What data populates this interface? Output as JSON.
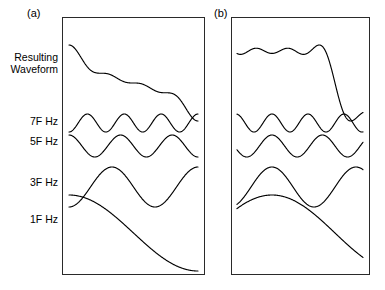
{
  "figure": {
    "type": "waveform-synthesis-diagram",
    "background": "#ffffff",
    "stroke_color": "#000000",
    "panel_border_color": "#2a2a2a"
  },
  "panels": [
    {
      "id": "a",
      "label": "(a)",
      "box": {
        "x": 62,
        "y": 17,
        "w": 143,
        "h": 258
      },
      "description": "All harmonics in cosine phase; sum is a flat-topped square-wave approximation with Gibbs ripples"
    },
    {
      "id": "b",
      "label": "(b)",
      "box": {
        "x": 231,
        "y": 17,
        "w": 139,
        "h": 258
      },
      "description": "Harmonics progressively phase-shifted; sum is a single sharp asymmetric peak"
    }
  ],
  "row_labels": {
    "resulting_line1": "Resulting",
    "resulting_line2": "Waveform",
    "harmonic_7": "7F Hz",
    "harmonic_5": "5F Hz",
    "harmonic_3": "3F Hz",
    "harmonic_1": "1F Hz"
  },
  "chart_data": {
    "type": "line",
    "title": "",
    "xlabel": "",
    "ylabel": "",
    "grid": false,
    "legend": "none",
    "x": {
      "range": [
        0,
        1
      ],
      "units": "normalized time",
      "ticks": []
    },
    "rows": [
      {
        "name": "Resulting Waveform",
        "label": "Resulting Waveform",
        "baseline_y": 82,
        "amplitude": 38
      },
      {
        "name": "7F Hz",
        "label": "7F Hz",
        "harmonic": 7,
        "baseline_y": 122,
        "amplitude": 9
      },
      {
        "name": "5F Hz",
        "label": "5F Hz",
        "harmonic": 5,
        "baseline_y": 145,
        "amplitude": 11
      },
      {
        "name": "3F Hz",
        "label": "3F Hz",
        "harmonic": 3,
        "baseline_y": 186,
        "amplitude": 20
      },
      {
        "name": "1F Hz",
        "label": "1F Hz",
        "harmonic": 1,
        "baseline_y": 232,
        "amplitude": 38
      }
    ],
    "series": [
      {
        "name": "panel-a-harmonic-1",
        "panel": "a",
        "harmonic": 1,
        "amplitude": 1.0,
        "phase_deg": 0,
        "cycles_in_window": 0.5,
        "values": [
          -0.99,
          -0.89,
          -0.67,
          -0.35,
          0.0,
          0.34,
          0.66,
          0.89,
          0.99,
          0.95,
          0.78
        ]
      },
      {
        "name": "panel-a-harmonic-3",
        "panel": "a",
        "harmonic": 3,
        "amplitude": 0.333,
        "phase_deg": 180,
        "cycles_in_window": 1.5,
        "values": [
          0.62,
          0.99,
          0.72,
          0.0,
          -0.72,
          -0.99,
          -0.72,
          0.0,
          0.72,
          0.99,
          0.62
        ]
      },
      {
        "name": "panel-a-harmonic-5",
        "panel": "a",
        "harmonic": 5,
        "amplitude": 0.2,
        "phase_deg": 0,
        "cycles_in_window": 2.5,
        "values": [
          -0.99,
          0.31,
          0.81,
          -0.81,
          -0.31,
          0.99,
          -0.31,
          -0.81,
          0.81,
          0.31,
          -0.99
        ]
      },
      {
        "name": "panel-a-harmonic-7",
        "panel": "a",
        "harmonic": 7,
        "amplitude": 0.143,
        "phase_deg": 180,
        "cycles_in_window": 3.5,
        "values": [
          0.99,
          -0.72,
          0.0,
          0.72,
          -0.99,
          0.72,
          0.0,
          -0.72,
          0.99,
          -0.72,
          0.0
        ]
      },
      {
        "name": "panel-a-resulting",
        "panel": "a",
        "composite_of": [
          1,
          3,
          5,
          7
        ],
        "shape": "square-wave-approximation",
        "values": [
          -0.95,
          0.3,
          0.88,
          0.72,
          0.85,
          0.74,
          0.86,
          0.73,
          0.88,
          0.32,
          -0.95
        ]
      },
      {
        "name": "panel-b-harmonic-1",
        "panel": "b",
        "harmonic": 1,
        "amplitude": 1.0,
        "phase_deg": -50,
        "cycles_in_window": 0.5,
        "values": [
          -0.55,
          -0.05,
          0.48,
          0.85,
          0.99,
          0.9,
          0.6,
          0.15,
          -0.35,
          -0.75,
          -0.98
        ]
      },
      {
        "name": "panel-b-harmonic-3",
        "panel": "b",
        "harmonic": 3,
        "amplitude": 0.333,
        "phase_deg": -150,
        "cycles_in_window": 1.5,
        "values": [
          -0.6,
          -0.15,
          0.55,
          0.99,
          0.62,
          -0.2,
          -0.85,
          -0.92,
          -0.3,
          0.55,
          0.99
        ]
      },
      {
        "name": "panel-b-harmonic-5",
        "panel": "b",
        "harmonic": 5,
        "amplitude": 0.2,
        "phase_deg": -250,
        "cycles_in_window": 2.5,
        "values": [
          -0.85,
          0.55,
          0.95,
          -0.25,
          -0.99,
          -0.15,
          0.95,
          0.45,
          -0.8,
          -0.7,
          0.7
        ]
      },
      {
        "name": "panel-b-harmonic-7",
        "panel": "b",
        "harmonic": 7,
        "amplitude": 0.143,
        "phase_deg": -350,
        "cycles_in_window": 3.5,
        "values": [
          -0.7,
          0.95,
          -0.3,
          -0.8,
          0.85,
          0.15,
          -0.99,
          0.55,
          0.6,
          -0.95,
          0.25
        ]
      },
      {
        "name": "panel-b-resulting",
        "panel": "b",
        "composite_of": [
          1,
          3,
          5,
          7
        ],
        "shape": "sharp-asymmetric-peak",
        "values": [
          -0.8,
          -0.55,
          -0.28,
          -0.22,
          0.3,
          0.99,
          0.25,
          -0.42,
          -0.45,
          -0.5,
          -0.62
        ]
      }
    ]
  }
}
